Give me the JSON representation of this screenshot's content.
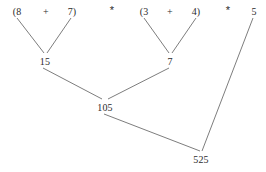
{
  "diagram": {
    "type": "expression-evaluation-tree",
    "expression": "(8 + 7) * (3 + 4) * 5",
    "background_color": "#ffffff",
    "line_color": "#6e6e6e",
    "text_color": "#2b2b2b",
    "width": 266,
    "height": 172,
    "tokens": [
      {
        "id": "tok-open8",
        "text": "(8",
        "x": 17,
        "y": 6
      },
      {
        "id": "tok-plus1",
        "text": "+",
        "x": 46,
        "y": 6
      },
      {
        "id": "tok-7close",
        "text": "7)",
        "x": 72,
        "y": 6
      },
      {
        "id": "tok-mult1",
        "text": "*",
        "x": 112,
        "y": 5
      },
      {
        "id": "tok-open3",
        "text": "(3",
        "x": 144,
        "y": 6
      },
      {
        "id": "tok-plus2",
        "text": "+",
        "x": 170,
        "y": 6
      },
      {
        "id": "tok-4close",
        "text": "4)",
        "x": 196,
        "y": 6
      },
      {
        "id": "tok-mult2",
        "text": "*",
        "x": 228,
        "y": 5
      },
      {
        "id": "tok-5",
        "text": "5",
        "x": 254,
        "y": 6
      }
    ],
    "nodes": [
      {
        "id": "node-15",
        "label": "15",
        "x": 45,
        "y": 56
      },
      {
        "id": "node-7",
        "label": "7",
        "x": 170,
        "y": 56
      },
      {
        "id": "node-105",
        "label": "105",
        "x": 105,
        "y": 102
      },
      {
        "id": "node-525",
        "label": "525",
        "x": 201,
        "y": 154
      }
    ],
    "edges": [
      {
        "id": "edge-8-to-15",
        "from": "tok-open8",
        "to": "node-15",
        "x1": 17,
        "y1": 18,
        "x2": 44,
        "y2": 53
      },
      {
        "id": "edge-7-to-15",
        "from": "tok-7close",
        "to": "node-15",
        "x1": 71,
        "y1": 18,
        "x2": 47,
        "y2": 53
      },
      {
        "id": "edge-3-to-7",
        "from": "tok-open3",
        "to": "node-7",
        "x1": 144,
        "y1": 18,
        "x2": 169,
        "y2": 53
      },
      {
        "id": "edge-4-to-7",
        "from": "tok-4close",
        "to": "node-7",
        "x1": 196,
        "y1": 18,
        "x2": 172,
        "y2": 53
      },
      {
        "id": "edge-15-to-105",
        "from": "node-15",
        "to": "node-105",
        "x1": 43,
        "y1": 68,
        "x2": 102,
        "y2": 99
      },
      {
        "id": "edge-7-to-105",
        "from": "node-7",
        "to": "node-105",
        "x1": 169,
        "y1": 68,
        "x2": 108,
        "y2": 99
      },
      {
        "id": "edge-105-to-525",
        "from": "node-105",
        "to": "node-525",
        "x1": 104,
        "y1": 114,
        "x2": 200,
        "y2": 151
      },
      {
        "id": "edge-5-to-525",
        "from": "tok-5",
        "to": "node-525",
        "x1": 253,
        "y1": 18,
        "x2": 202,
        "y2": 151
      }
    ]
  }
}
